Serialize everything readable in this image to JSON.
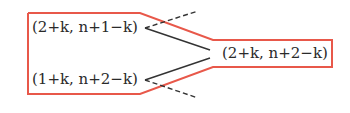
{
  "nodes": [
    {
      "id": "top-left",
      "text": "(2+k, n+1−k)"
    },
    {
      "id": "bottom-left",
      "text": "(1+k, n+2−k)"
    },
    {
      "id": "right",
      "text": "(2+k, n+2−k)"
    }
  ],
  "colors": {
    "outline": "#e8584a",
    "line": "#333333",
    "text": "#2a2a2a",
    "background": "#ffffff"
  }
}
